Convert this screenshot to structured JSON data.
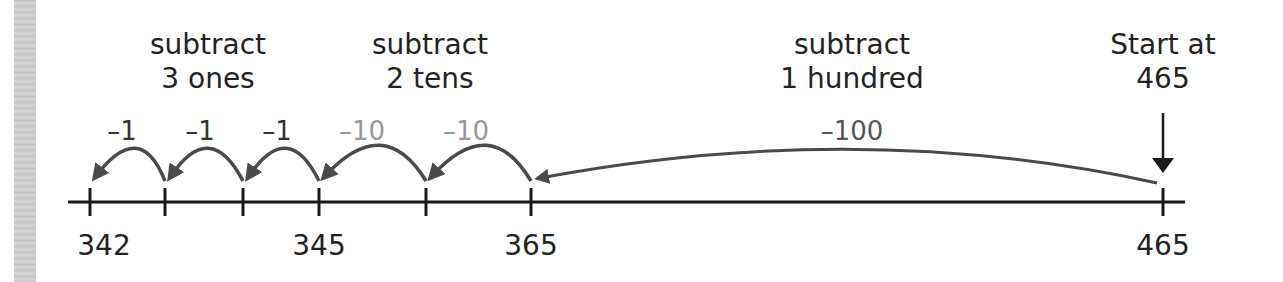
{
  "groups": [
    {
      "line1": "subtract",
      "line2": "3 ones"
    },
    {
      "line1": "subtract",
      "line2": "2 tens"
    },
    {
      "line1": "subtract",
      "line2": "1 hundred"
    },
    {
      "line1": "Start at",
      "line2": "465"
    }
  ],
  "steps": [
    {
      "label": "–1",
      "color": "#333333"
    },
    {
      "label": "–1",
      "color": "#333333"
    },
    {
      "label": "–1",
      "color": "#333333"
    },
    {
      "label": "–10",
      "color": "#999999"
    },
    {
      "label": "–10",
      "color": "#999999"
    },
    {
      "label": "–100",
      "color": "#555555"
    }
  ],
  "tick_labels": [
    "342",
    "345",
    "365",
    "465"
  ],
  "colors": {
    "axis": "#1a1a1a",
    "arrow": "#4a4a4a",
    "ones": "#333333",
    "tens": "#999999"
  }
}
